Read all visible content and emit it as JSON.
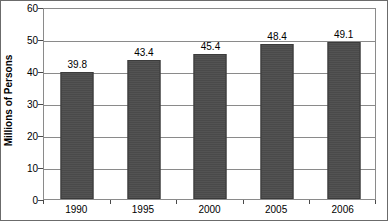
{
  "chart_data": {
    "type": "bar",
    "title": "",
    "subtitle": "",
    "xlabel": "",
    "ylabel": "Millions of Persons",
    "categories": [
      "1990",
      "1995",
      "2000",
      "2005",
      "2006"
    ],
    "values": [
      39.8,
      43.4,
      45.4,
      48.4,
      49.1
    ],
    "value_labels": [
      "39.8",
      "43.4",
      "45.4",
      "48.4",
      "49.1"
    ],
    "series": [
      {
        "name": "Persons",
        "values": [
          39.8,
          43.4,
          45.4,
          48.4,
          49.1
        ]
      }
    ],
    "ylim": [
      0,
      60
    ],
    "ytick_step": 10,
    "yticks": [
      0,
      10,
      20,
      30,
      40,
      50,
      60
    ],
    "ytick_labels": [
      "0",
      "10",
      "20",
      "30",
      "40",
      "50",
      "60"
    ],
    "grid": true,
    "grid_axis": "y",
    "legend": false,
    "legend_position": "none",
    "bar_color": "#4b4b4b",
    "gridline_color": "#8a8a8a",
    "text_color": "#000000",
    "background_color": "#ffffff",
    "data_labels_shown": true
  }
}
